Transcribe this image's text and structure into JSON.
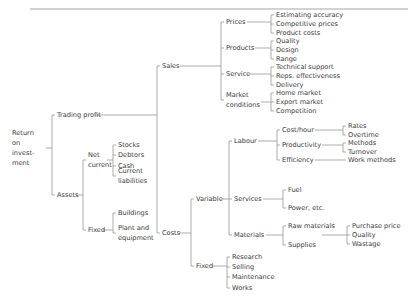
{
  "figure": {
    "kind": "tree-diagram",
    "title_text": "",
    "text_color": "#3a3a3a",
    "line_color": "#8a8a8a",
    "rule_color": "#9a9a9a",
    "background": "#ffffff"
  },
  "decorations": {
    "top_rule": {
      "x1": 30,
      "y1": 9,
      "x2": 408,
      "y2": 9
    }
  },
  "nodes": [
    {
      "id": "root",
      "label": "Return\non invest-\nment",
      "x": 12,
      "y": 148,
      "lines": [
        "Return",
        "on",
        "invest-",
        "ment"
      ]
    },
    {
      "id": "trading-profit",
      "label": "Trading profit",
      "x": 57,
      "y": 115,
      "lines": [
        "Trading profit"
      ]
    },
    {
      "id": "assets",
      "label": "Assets",
      "x": 57,
      "y": 195,
      "lines": [
        "Assets"
      ]
    },
    {
      "id": "net-current",
      "label": "Net\ncurrent",
      "x": 88,
      "y": 160,
      "lines": [
        "Net",
        "current"
      ]
    },
    {
      "id": "fixed-assets",
      "label": "Fixed",
      "x": 88,
      "y": 230,
      "lines": [
        "Fixed"
      ]
    },
    {
      "id": "stocks",
      "label": "Stocks",
      "x": 118,
      "y": 145,
      "lines": [
        "Stocks"
      ]
    },
    {
      "id": "debtors",
      "label": "Debtors",
      "x": 118,
      "y": 155,
      "lines": [
        "Debtors"
      ]
    },
    {
      "id": "cash",
      "label": "Cash",
      "x": 118,
      "y": 166,
      "lines": [
        "Cash"
      ]
    },
    {
      "id": "current-liabilities",
      "label": "Current\nliabilities",
      "x": 118,
      "y": 176,
      "lines": [
        "Current",
        "liabilities"
      ]
    },
    {
      "id": "buildings",
      "label": "Buildings",
      "x": 118,
      "y": 213,
      "lines": [
        "Buildings"
      ]
    },
    {
      "id": "plant-equipment",
      "label": "Plant and\nequipment",
      "x": 118,
      "y": 233,
      "lines": [
        "Plant and",
        "equipment"
      ]
    },
    {
      "id": "sales",
      "label": "Sales",
      "x": 162,
      "y": 66,
      "lines": [
        "Sales"
      ]
    },
    {
      "id": "costs",
      "label": "Costs",
      "x": 162,
      "y": 233,
      "lines": [
        "Costs"
      ]
    },
    {
      "id": "prices",
      "label": "Prices",
      "x": 226,
      "y": 22,
      "lines": [
        "Prices"
      ]
    },
    {
      "id": "products",
      "label": "Products",
      "x": 226,
      "y": 48,
      "lines": [
        "Products"
      ]
    },
    {
      "id": "service",
      "label": "Service",
      "x": 226,
      "y": 74,
      "lines": [
        "Service"
      ]
    },
    {
      "id": "market-conditions",
      "label": "Market\nconditions",
      "x": 226,
      "y": 100,
      "lines": [
        "Market",
        "conditions"
      ]
    },
    {
      "id": "estimating-accuracy",
      "label": "Estimating accuracy",
      "x": 276,
      "y": 15,
      "lines": [
        "Estimating accuracy"
      ]
    },
    {
      "id": "competitive-prices",
      "label": "Competitive prices",
      "x": 276,
      "y": 24,
      "lines": [
        "Competitive prices"
      ]
    },
    {
      "id": "product-costs",
      "label": "Product costs",
      "x": 276,
      "y": 33,
      "lines": [
        "Product costs"
      ]
    },
    {
      "id": "quality-prod",
      "label": "Quality",
      "x": 276,
      "y": 41,
      "lines": [
        "Quality"
      ]
    },
    {
      "id": "design",
      "label": "Design",
      "x": 276,
      "y": 50,
      "lines": [
        "Design"
      ]
    },
    {
      "id": "range",
      "label": "Range",
      "x": 276,
      "y": 59,
      "lines": [
        "Range"
      ]
    },
    {
      "id": "technical-support",
      "label": "Technical support",
      "x": 276,
      "y": 67,
      "lines": [
        "Technical support"
      ]
    },
    {
      "id": "reps-effectiveness",
      "label": "Reps. effectiveness",
      "x": 276,
      "y": 76,
      "lines": [
        "Reps. effectiveness"
      ]
    },
    {
      "id": "delivery",
      "label": "Delivery",
      "x": 276,
      "y": 85,
      "lines": [
        "Delivery"
      ]
    },
    {
      "id": "home-market",
      "label": "Home market",
      "x": 276,
      "y": 93,
      "lines": [
        "Home market"
      ]
    },
    {
      "id": "export-market",
      "label": "Export market",
      "x": 276,
      "y": 102,
      "lines": [
        "Export market"
      ]
    },
    {
      "id": "competition",
      "label": "Competition",
      "x": 276,
      "y": 111,
      "lines": [
        "Competition"
      ]
    },
    {
      "id": "variable",
      "label": "Variable",
      "x": 196,
      "y": 199,
      "lines": [
        "Variable"
      ]
    },
    {
      "id": "fixed-costs",
      "label": "Fixed",
      "x": 196,
      "y": 266,
      "lines": [
        "Fixed"
      ]
    },
    {
      "id": "labour",
      "label": "Labour",
      "x": 234,
      "y": 141,
      "lines": [
        "Labour"
      ]
    },
    {
      "id": "services",
      "label": "Services",
      "x": 234,
      "y": 199,
      "lines": [
        "Services"
      ]
    },
    {
      "id": "materials",
      "label": "Materials",
      "x": 234,
      "y": 235,
      "lines": [
        "Materials"
      ]
    },
    {
      "id": "cost-hour",
      "label": "Cost/hour",
      "x": 282,
      "y": 130,
      "lines": [
        "Cost/hour"
      ]
    },
    {
      "id": "productivity",
      "label": "Productivity",
      "x": 282,
      "y": 145,
      "lines": [
        "Productivity"
      ]
    },
    {
      "id": "efficiency",
      "label": "Efficiency",
      "x": 282,
      "y": 160,
      "lines": [
        "Efficiency"
      ]
    },
    {
      "id": "rates",
      "label": "Rates",
      "x": 348,
      "y": 126,
      "lines": [
        "Rates"
      ]
    },
    {
      "id": "overtime",
      "label": "Overtime",
      "x": 348,
      "y": 135,
      "lines": [
        "Overtime"
      ]
    },
    {
      "id": "methods",
      "label": "Methods",
      "x": 348,
      "y": 143,
      "lines": [
        "Methods"
      ]
    },
    {
      "id": "turnover",
      "label": "Turnover",
      "x": 348,
      "y": 152,
      "lines": [
        "Turnover"
      ]
    },
    {
      "id": "work-methods",
      "label": "Work methods",
      "x": 348,
      "y": 160,
      "lines": [
        "Work methods"
      ]
    },
    {
      "id": "fuel",
      "label": "Fuel",
      "x": 288,
      "y": 190,
      "lines": [
        "Fuel"
      ]
    },
    {
      "id": "power-etc",
      "label": "Power, etc.",
      "x": 288,
      "y": 208,
      "lines": [
        "Power, etc."
      ]
    },
    {
      "id": "raw-materials",
      "label": "Raw materials",
      "x": 288,
      "y": 226,
      "lines": [
        "Raw materials"
      ]
    },
    {
      "id": "supplies",
      "label": "Supplies",
      "x": 288,
      "y": 245,
      "lines": [
        "Supplies"
      ]
    },
    {
      "id": "purchase-price",
      "label": "Purchase price",
      "x": 352,
      "y": 226,
      "lines": [
        "Purchase price"
      ]
    },
    {
      "id": "quality-mat",
      "label": "Quality",
      "x": 352,
      "y": 235,
      "lines": [
        "Quality"
      ]
    },
    {
      "id": "wastage",
      "label": "Wastage",
      "x": 352,
      "y": 244,
      "lines": [
        "Wastage"
      ]
    },
    {
      "id": "research",
      "label": "Research",
      "x": 232,
      "y": 257,
      "lines": [
        "Research"
      ]
    },
    {
      "id": "selling",
      "label": "Selling",
      "x": 232,
      "y": 267,
      "lines": [
        "Selling"
      ]
    },
    {
      "id": "maintenance",
      "label": "Maintenance",
      "x": 232,
      "y": 277,
      "lines": [
        "Maintenance"
      ]
    },
    {
      "id": "works",
      "label": "Works",
      "x": 232,
      "y": 288,
      "lines": [
        "Works"
      ]
    }
  ],
  "connectors": [
    {
      "from": "root",
      "to": [
        "trading-profit",
        "assets"
      ],
      "path": "M 46 148 L 52 148 M 52 148 L 52 115 L 55 115 M 52 148 L 52 195 L 55 195"
    },
    {
      "from": "trading-profit",
      "to": [
        "sales",
        "costs"
      ],
      "path": "M 95 115 L 157 115 M 157 115 L 157 66 L 160 66 M 157 115 L 157 233 L 160 233"
    },
    {
      "from": "assets",
      "to": [
        "net-current",
        "fixed-assets"
      ],
      "path": "M 76 195 L 83 195 M 83 195 L 83 160 L 86 160 M 83 195 L 83 230 L 86 230"
    },
    {
      "from": "net-current",
      "to": [
        "stocks",
        "debtors",
        "cash",
        "current-liabilities"
      ],
      "path": "M 107 160 L 113 160 M 113 145 L 113 176 M 113 145 L 116 145 M 113 155 L 116 155 M 113 166 L 116 166 M 113 176 L 116 176"
    },
    {
      "from": "fixed-assets",
      "to": [
        "buildings",
        "plant-equipment"
      ],
      "path": "M 103 230 L 113 230 M 113 213 L 113 233 M 113 213 L 116 213 M 113 233 L 116 233"
    },
    {
      "from": "sales",
      "to": [
        "prices",
        "products",
        "service",
        "market-conditions"
      ],
      "path": "M 180 66 L 221 66 M 221 22 L 221 100 M 221 22 L 224 22 M 221 48 L 224 48 M 221 74 L 224 74 M 221 100 L 224 100"
    },
    {
      "from": "prices",
      "to": [
        "estimating-accuracy",
        "competitive-prices",
        "product-costs"
      ],
      "path": "M 247 22 L 271 22 M 271 15 L 271 33 M 271 15 L 274 15 M 271 24 L 274 24 M 271 33 L 274 33"
    },
    {
      "from": "products",
      "to": [
        "quality-prod",
        "design",
        "range"
      ],
      "path": "M 255 48 L 271 48 M 271 41 L 271 59 M 271 41 L 274 41 M 271 50 L 274 50 M 271 59 L 274 59"
    },
    {
      "from": "service",
      "to": [
        "technical-support",
        "reps-effectiveness",
        "delivery"
      ],
      "path": "M 250 74 L 271 74 M 271 67 L 271 85 M 271 67 L 274 67 M 271 76 L 274 76 M 271 85 L 274 85"
    },
    {
      "from": "market-conditions",
      "to": [
        "home-market",
        "export-market",
        "competition"
      ],
      "path": "M 261 102 L 271 102 M 271 93 L 271 111 M 271 93 L 274 93 M 271 102 L 274 102 M 271 111 L 274 111"
    },
    {
      "from": "costs",
      "to": [
        "variable",
        "fixed-costs"
      ],
      "path": "M 179 233 L 191 233 M 191 199 L 191 266 M 191 199 L 194 199 M 191 266 L 194 266"
    },
    {
      "from": "variable",
      "to": [
        "labour",
        "services",
        "materials"
      ],
      "path": "M 222 199 L 229 199 M 229 141 L 229 235 M 229 141 L 232 141 M 229 199 L 232 199 M 229 235 L 232 235"
    },
    {
      "from": "labour",
      "to": [
        "cost-hour",
        "productivity",
        "efficiency"
      ],
      "path": "M 258 141 L 277 141 M 277 130 L 277 160 M 277 130 L 280 130 M 277 145 L 280 145 M 277 160 L 280 160"
    },
    {
      "from": "cost-hour",
      "to": [
        "rates",
        "overtime"
      ],
      "path": "M 315 130 L 343 130 M 343 126 L 343 135 M 343 126 L 346 126 M 343 135 L 346 135"
    },
    {
      "from": "productivity",
      "to": [
        "methods",
        "turnover"
      ],
      "path": "M 322 145 L 343 145 M 343 143 L 343 152 M 343 143 L 346 143 M 343 152 L 346 152"
    },
    {
      "from": "efficiency",
      "to": [
        "work-methods"
      ],
      "path": "M 315 160 L 346 160"
    },
    {
      "from": "services",
      "to": [
        "fuel",
        "power-etc"
      ],
      "path": "M 263 199 L 283 199 M 283 190 L 283 208 M 283 190 L 286 190 M 283 208 L 286 208"
    },
    {
      "from": "materials",
      "to": [
        "raw-materials",
        "supplies"
      ],
      "path": "M 266 235 L 283 235 M 283 226 L 283 245 M 283 226 L 286 226 M 283 245 L 286 245"
    },
    {
      "from": "raw-materials-supplies",
      "to": [
        "purchase-price",
        "quality-mat",
        "wastage"
      ],
      "path": "M 322 235 L 347 235 M 347 226 L 347 244 M 347 226 L 350 226 M 347 235 L 350 235 M 347 244 L 350 244"
    },
    {
      "from": "fixed-costs",
      "to": [
        "research",
        "selling",
        "maintenance",
        "works"
      ],
      "path": "M 212 266 L 227 266 M 227 257 L 227 288 M 227 257 L 230 257 M 227 267 L 230 267 M 227 277 L 230 277 M 227 288 L 230 288"
    }
  ]
}
